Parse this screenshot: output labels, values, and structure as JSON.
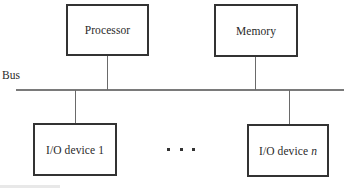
{
  "diagram": {
    "bus_label": "Bus",
    "top_nodes": [
      {
        "label": "Processor"
      },
      {
        "label": "Memory"
      }
    ],
    "bottom_nodes": [
      {
        "label": "I/O device 1",
        "suffix": ""
      },
      {
        "label": "I/O device",
        "suffix": "n"
      }
    ],
    "ellipsis": "· · ·"
  }
}
